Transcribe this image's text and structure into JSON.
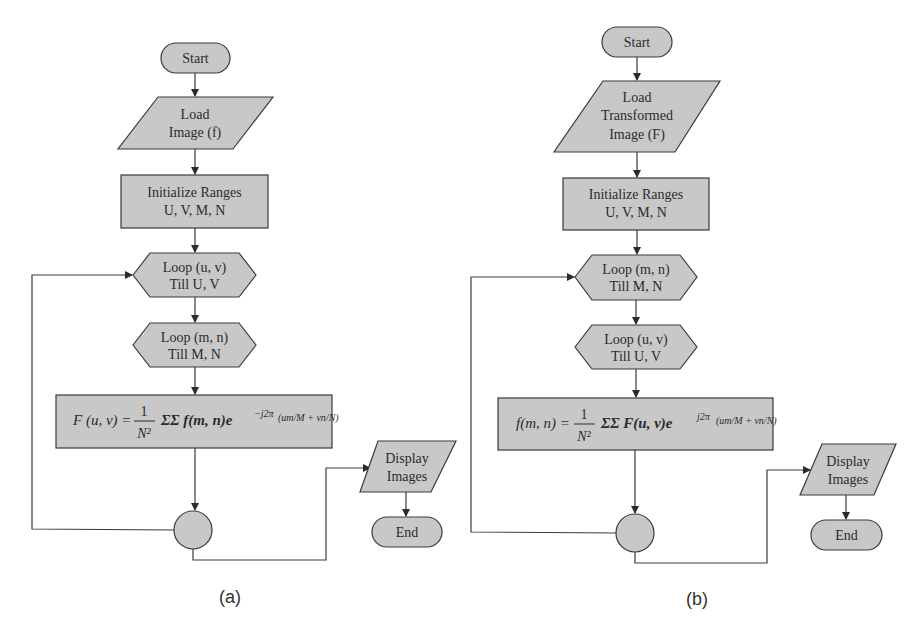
{
  "figure": {
    "colors": {
      "node_fill": "#c8c8c8",
      "stroke": "#3a3a3a",
      "background": "#ffffff",
      "text": "#2b2b2b"
    },
    "panel_a": {
      "caption": "(a)",
      "start": "Start",
      "load": [
        "Load",
        "Image (f)"
      ],
      "init": [
        "Initialize Ranges",
        "U, V, M, N"
      ],
      "loop_outer": [
        "Loop (u, v)",
        "Till U, V"
      ],
      "loop_inner": [
        "Loop (m, n)",
        "Till M, N"
      ],
      "formula": {
        "lhs": "F (u, v) =",
        "frac_num": "1",
        "frac_den": "N²",
        "sum": "ΣΣ f(m, n)e",
        "exponent": "−j2π",
        "inner": "(um/M + vn/N)",
        "full": "F(u, v) = 1/N² ΣΣ f(m, n) e^(−j2π(um/M + vn/N))"
      },
      "display": [
        "Display",
        "Images"
      ],
      "end": "End"
    },
    "panel_b": {
      "caption": "(b)",
      "start": "Start",
      "load": [
        "Load",
        "Transformed",
        "Image (F)"
      ],
      "init": [
        "Initialize Ranges",
        "U, V, M, N"
      ],
      "loop_outer": [
        "Loop (m, n)",
        "Till M, N"
      ],
      "loop_inner": [
        "Loop (u, v)",
        "Till U, V"
      ],
      "formula": {
        "lhs": "f(m, n) =",
        "frac_num": "1",
        "frac_den": "N²",
        "sum": "ΣΣ F(u, v)e",
        "exponent": "j2π",
        "inner": "(um/M + vn/N)",
        "full": "f(m, n) = 1/N² ΣΣ F(u, v) e^(j2π(um/M + vn/N))"
      },
      "display": [
        "Display",
        "Images"
      ],
      "end": "End"
    }
  }
}
